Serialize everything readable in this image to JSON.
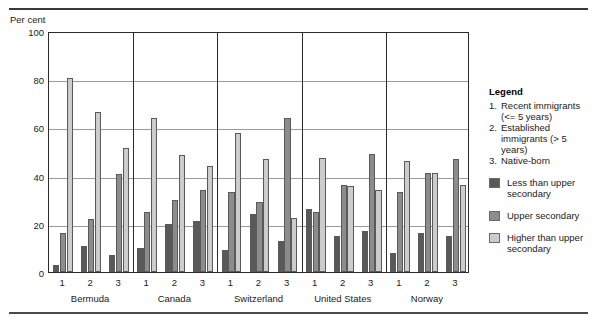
{
  "figure": {
    "axis_title": "Per cent"
  },
  "legend": {
    "title": "Legend",
    "numbered": [
      {
        "num": "1.",
        "text": "Recent immigrants (<= 5 years)"
      },
      {
        "num": "2.",
        "text": "Established immigrants (> 5 years)"
      },
      {
        "num": "3.",
        "text": "Native-born"
      }
    ],
    "series": [
      {
        "label": "Less than upper secondary",
        "color": "#595959"
      },
      {
        "label": "Upper secondary",
        "color": "#8c8c8c"
      },
      {
        "label": "Higher than upper secondary",
        "color": "#cccccc"
      }
    ]
  },
  "chart_data": {
    "type": "bar",
    "title": "",
    "xlabel": "",
    "ylabel": "Per cent",
    "ylim": [
      0,
      100
    ],
    "yticks": [
      0,
      20,
      40,
      60,
      80,
      100
    ],
    "grid": true,
    "legend_position": "right",
    "countries": [
      "Bermuda",
      "Canada",
      "Switzerland",
      "United States",
      "Norway"
    ],
    "groups": [
      "1",
      "2",
      "3"
    ],
    "group_names": [
      "Recent immigrants (<= 5 years)",
      "Established immigrants (> 5 years)",
      "Native-born"
    ],
    "categories": [
      "Bermuda 1",
      "Bermuda 2",
      "Bermuda 3",
      "Canada 1",
      "Canada 2",
      "Canada 3",
      "Switzerland 1",
      "Switzerland 2",
      "Switzerland 3",
      "United States 1",
      "United States 2",
      "United States 3",
      "Norway 1",
      "Norway 2",
      "Norway 3"
    ],
    "series": [
      {
        "name": "Less than upper secondary",
        "color": "#595959",
        "values": [
          3,
          11,
          7,
          10,
          20,
          21,
          9,
          24,
          13,
          26,
          15,
          17,
          8,
          16,
          15
        ]
      },
      {
        "name": "Upper secondary",
        "color": "#8c8c8c",
        "values": [
          16,
          22,
          40.5,
          25,
          30,
          34,
          33,
          29,
          64,
          25,
          36,
          49,
          33,
          41,
          47
        ]
      },
      {
        "name": "Higher than upper secondary",
        "color": "#cccccc",
        "values": [
          80.5,
          66.5,
          51.5,
          64,
          48.5,
          44,
          57.5,
          47,
          22.5,
          47.5,
          35.5,
          34,
          46,
          41,
          36
        ]
      }
    ]
  }
}
